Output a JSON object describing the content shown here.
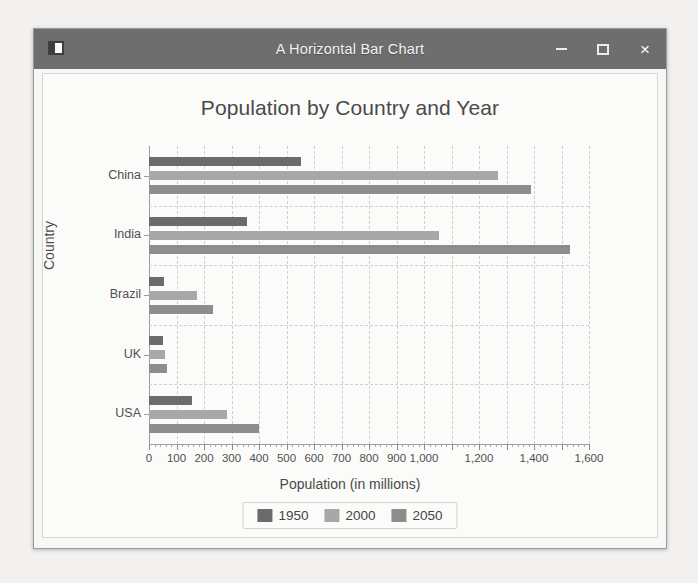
{
  "window": {
    "title": "A Horizontal Bar Chart",
    "icon": "app-icon",
    "buttons": {
      "minimize": "–",
      "maximize": "□",
      "close": "×"
    }
  },
  "chart_data": {
    "type": "bar",
    "orientation": "horizontal",
    "title": "Population by Country and Year",
    "xlabel": "Population (in millions)",
    "ylabel": "Country",
    "categories": [
      "China",
      "India",
      "Brazil",
      "UK",
      "USA"
    ],
    "series": [
      {
        "name": "1950",
        "color": "#6b6b6b",
        "values": [
          554,
          357,
          54,
          50,
          158
        ]
      },
      {
        "name": "2000",
        "color": "#a8a8a8",
        "values": [
          1270,
          1053,
          175,
          59,
          282
        ]
      },
      {
        "name": "2050",
        "color": "#8d8d8d",
        "values": [
          1390,
          1530,
          233,
          65,
          400
        ]
      }
    ],
    "xlim": [
      0,
      1600
    ],
    "xticks": [
      0,
      100,
      200,
      300,
      400,
      500,
      600,
      700,
      800,
      900,
      1000,
      1100,
      1200,
      1300,
      1400,
      1500,
      1600
    ],
    "xtick_labels": [
      "0",
      "100",
      "200",
      "300",
      "400",
      "500",
      "600",
      "700",
      "800",
      "900",
      "1,000",
      "",
      "1,200",
      "",
      "1,400",
      "",
      "1,600"
    ],
    "grid": true,
    "legend_position": "bottom",
    "legend": [
      "1950",
      "2000",
      "2050"
    ]
  }
}
